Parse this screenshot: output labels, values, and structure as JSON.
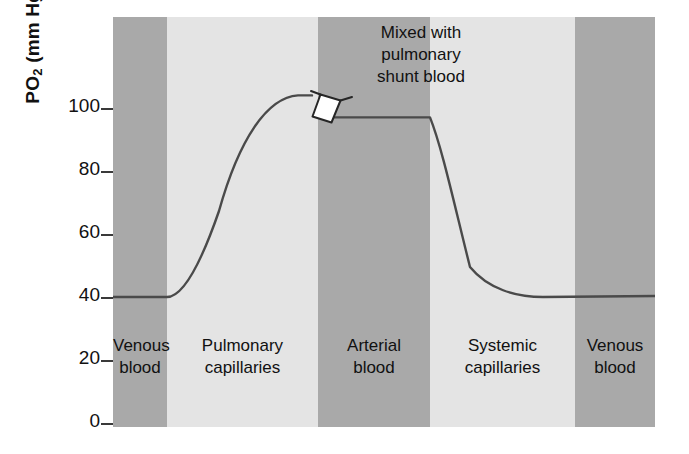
{
  "chart_data": {
    "type": "line",
    "title": "",
    "xlabel": "",
    "ylabel": "PO2 (mm Hg)",
    "ylabel_main": "PO",
    "ylabel_sub": "2",
    "ylabel_units": " (mm Hg)",
    "ylim": [
      0,
      120
    ],
    "yticks": [
      0,
      20,
      40,
      60,
      80,
      100
    ],
    "ytick_labels": [
      "0",
      "20",
      "40",
      "60",
      "80",
      "100"
    ],
    "grid": false,
    "legend": "none",
    "axis_note": "y-axis ticks only; no x-axis tick labels",
    "annotations": [
      {
        "name": "shunt-annotation",
        "text": "Mixed with\npulmonary\nshunt blood",
        "line1": "Mixed with",
        "line2": "pulmonary",
        "line3": "shunt blood",
        "points_to": "step-down in curve at arterial blood boundary"
      }
    ],
    "bands": [
      {
        "label_line1": "Venous",
        "label_line2": "blood",
        "shade": "dark",
        "color": "#a9a9a9"
      },
      {
        "label_line1": "Pulmonary",
        "label_line2": "capillaries",
        "shade": "light",
        "color": "#e4e4e4"
      },
      {
        "label_line1": "Arterial",
        "label_line2": "blood",
        "shade": "dark",
        "color": "#a9a9a9"
      },
      {
        "label_line1": "Systemic",
        "label_line2": "capillaries",
        "shade": "light",
        "color": "#e4e4e4"
      },
      {
        "label_line1": "Venous",
        "label_line2": "blood",
        "shade": "dark",
        "color": "#a9a9a9"
      }
    ],
    "series": [
      {
        "name": "PO2",
        "color": "#4a4a4a",
        "values_description": "Venous blood plateau 40 mm Hg; rises through pulmonary capillaries to 104 mm Hg; steps down to 97 mm Hg after mixing with pulmonary shunt blood; arterial blood plateau 97 mm Hg; falls through systemic capillaries back to 40 mm Hg",
        "key_values": {
          "venous_plateau": 40,
          "pulmonary_end_capillary": 104,
          "arterial_after_shunt": 97,
          "systemic_end_venous": 40
        }
      }
    ],
    "colors": {
      "band_dark": "#a9a9a9",
      "band_light": "#e4e4e4",
      "curve": "#4a4a4a",
      "text": "#111111",
      "background": "#ffffff"
    }
  }
}
